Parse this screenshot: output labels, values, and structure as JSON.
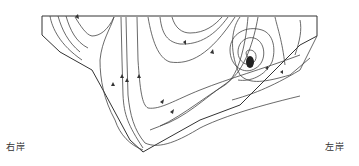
{
  "figure": {
    "type": "cross-section streamline diagram",
    "labels": {
      "right_bank": "右岸",
      "left_bank": "左岸"
    },
    "features": {
      "vortex": "clockwise spiral eddy near left bank, center approx (249,58)",
      "water_surface": "horizontal top line",
      "channel_bed": "V-shaped bottom with deepest point near center-left"
    }
  }
}
